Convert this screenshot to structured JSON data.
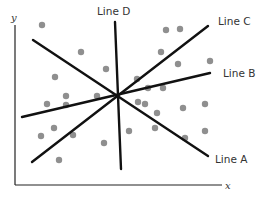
{
  "axes": {
    "x_label": "x",
    "y_label": "y"
  },
  "lines": [
    {
      "name": "Line A",
      "x1": 33,
      "y1": 40,
      "x2": 208,
      "y2": 156
    },
    {
      "name": "Line B",
      "x1": 22,
      "y1": 117,
      "x2": 210,
      "y2": 73
    },
    {
      "name": "Line C",
      "x1": 32,
      "y1": 162,
      "x2": 208,
      "y2": 26
    },
    {
      "name": "Line D",
      "x1": 115,
      "y1": 22,
      "x2": 121,
      "y2": 169
    }
  ],
  "labels": {
    "line_a": "Line A",
    "line_b": "Line B",
    "line_c": "Line C",
    "line_d": "Line D"
  },
  "dots": [
    [
      42,
      25
    ],
    [
      81,
      52
    ],
    [
      106,
      69
    ],
    [
      55,
      77
    ],
    [
      66,
      96
    ],
    [
      97,
      96
    ],
    [
      47,
      104
    ],
    [
      66,
      105
    ],
    [
      41,
      136
    ],
    [
      54,
      128
    ],
    [
      73,
      135
    ],
    [
      59,
      160
    ],
    [
      104,
      143
    ],
    [
      129,
      131
    ],
    [
      138,
      102
    ],
    [
      137,
      79
    ],
    [
      161,
      52
    ],
    [
      180,
      29
    ],
    [
      210,
      61
    ],
    [
      178,
      64
    ],
    [
      163,
      88
    ],
    [
      148,
      88
    ],
    [
      157,
      113
    ],
    [
      145,
      104
    ],
    [
      183,
      108
    ],
    [
      205,
      104
    ],
    [
      155,
      128
    ],
    [
      185,
      138
    ],
    [
      205,
      131
    ],
    [
      166,
      30
    ]
  ]
}
